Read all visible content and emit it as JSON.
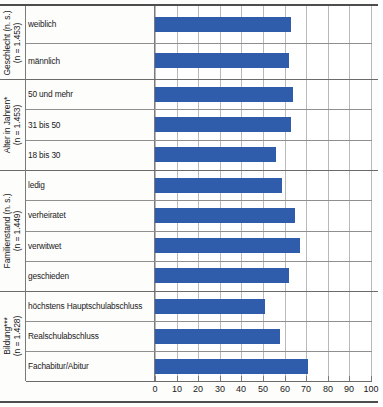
{
  "chart_data": {
    "type": "bar",
    "orientation": "horizontal",
    "title": "",
    "xlabel": "",
    "ylabel": "",
    "xlim": [
      0,
      100
    ],
    "xticks": [
      0,
      10,
      20,
      30,
      40,
      50,
      60,
      70,
      80,
      90,
      100
    ],
    "grid": true,
    "legend": "none",
    "bar_color": "#2f5cab",
    "groups": [
      {
        "name": "Geschlecht (n. s.)",
        "label_line1": "Geschlecht (n. s.)",
        "label_line2": "(n = 1.453)",
        "categories": [
          "weiblich",
          "männlich"
        ],
        "values": [
          63,
          62
        ]
      },
      {
        "name": "Alter in Jahren*",
        "label_line1": "Alter in Jahren*",
        "label_line2": "(n = 1.453)",
        "categories": [
          "50 und mehr",
          "31 bis 50",
          "18 bis 30"
        ],
        "values": [
          64,
          63,
          56
        ]
      },
      {
        "name": "Familienstand (n. s.)",
        "label_line1": "Familienstand (n. s.)",
        "label_line2": "(n = 1.449)",
        "categories": [
          "ledig",
          "verheiratet",
          "verwitwet",
          "geschieden"
        ],
        "values": [
          59,
          65,
          67,
          62
        ]
      },
      {
        "name": "Bildung***",
        "label_line1": "Bildung***",
        "label_line2": "(n = 1.428)",
        "categories": [
          "höchstens Hauptschulabschluss",
          "Realschulabschluss",
          "Fachabitur/Abitur"
        ],
        "values": [
          51,
          58,
          71
        ]
      }
    ],
    "categories": [
      "weiblich",
      "männlich",
      "50 und mehr",
      "31 bis 50",
      "18 bis 30",
      "ledig",
      "verheiratet",
      "verwitwet",
      "geschieden",
      "höchstens Hauptschulabschluss",
      "Realschulabschluss",
      "Fachabitur/Abitur"
    ],
    "values": [
      63,
      62,
      64,
      63,
      56,
      59,
      65,
      67,
      62,
      51,
      58,
      71
    ]
  }
}
